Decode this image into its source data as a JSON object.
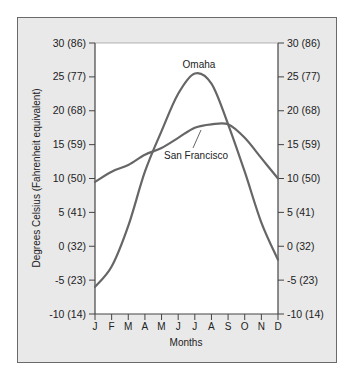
{
  "chart_data": {
    "type": "line",
    "title": "",
    "xlabel": "Months",
    "ylabel": "Degrees Celsius (Fahrenheit equivalent)",
    "ylim": [
      -10,
      30
    ],
    "categories": [
      "J",
      "F",
      "M",
      "A",
      "M",
      "J",
      "J",
      "A",
      "S",
      "O",
      "N",
      "D"
    ],
    "y_ticks": [
      {
        "value": 30,
        "label": "30 (86)"
      },
      {
        "value": 25,
        "label": "25 (77)"
      },
      {
        "value": 20,
        "label": "20 (68)"
      },
      {
        "value": 15,
        "label": "15 (59)"
      },
      {
        "value": 10,
        "label": "10 (50)"
      },
      {
        "value": 5,
        "label": "5 (41)"
      },
      {
        "value": 0,
        "label": "0 (32)"
      },
      {
        "value": -5,
        "label": "-5 (23)"
      },
      {
        "value": -10,
        "label": "-10 (14)"
      }
    ],
    "series": [
      {
        "name": "Omaha",
        "values": [
          -6,
          -3,
          3,
          11,
          17,
          22.5,
          25.5,
          24,
          18,
          11,
          3.5,
          -2
        ]
      },
      {
        "name": "San Francisco",
        "values": [
          9.5,
          11,
          12,
          13.5,
          14.5,
          16,
          17.5,
          18,
          18,
          16,
          13,
          10
        ]
      }
    ],
    "grid": false,
    "legend": "inline labels"
  },
  "colors": {
    "line": "#666666",
    "frame_bg": "#e9e9e9",
    "plot_bg": "#ffffff"
  }
}
